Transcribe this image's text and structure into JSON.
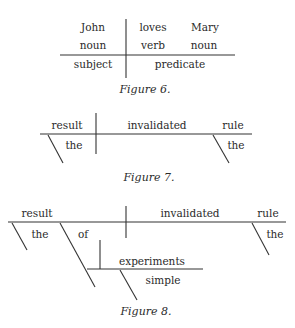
{
  "header": {
    "text": ""
  },
  "figure6": {
    "caption": "Figure 6.",
    "row1": [
      "John",
      "loves",
      "Mary"
    ],
    "row2": [
      "noun",
      "verb",
      "noun"
    ],
    "row3": [
      "subject",
      "predicate"
    ]
  },
  "figure7": {
    "caption": "Figure 7.",
    "subject": "result",
    "verb": "invalidated",
    "object": "rule",
    "subject_modifier": "the",
    "object_modifier": "the"
  },
  "figure8": {
    "caption": "Figure 8.",
    "subject": "result",
    "verb": "invalidated",
    "object": "rule",
    "subject_modifier": "the",
    "preposition": "of",
    "prep_object": "experiments",
    "prep_object_modifier": "simple",
    "object_modifier": "the"
  }
}
